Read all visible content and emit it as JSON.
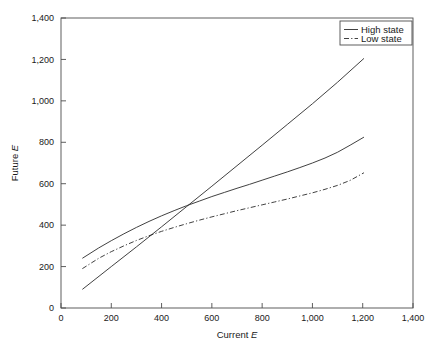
{
  "chart_data": {
    "type": "line",
    "title": "",
    "xlabel": "Current E",
    "ylabel": "Future E",
    "xlim": [
      0,
      1400
    ],
    "ylim": [
      0,
      1400
    ],
    "xticks": [
      "0",
      "200",
      "400",
      "600",
      "800",
      "1,000",
      "1,200",
      "1,400"
    ],
    "yticks": [
      "0",
      "200",
      "400",
      "600",
      "800",
      "1,000",
      "1,200",
      "1,400"
    ],
    "xtick_values": [
      0,
      200,
      400,
      600,
      800,
      1000,
      1200,
      1400
    ],
    "ytick_values": [
      0,
      200,
      400,
      600,
      800,
      1000,
      1200,
      1400
    ],
    "grid": false,
    "legend_position": "top-right",
    "legend": [
      "High state",
      "Low state"
    ],
    "series": [
      {
        "name": "High state",
        "style": "solid",
        "color": "#2b2b2b",
        "comment": "concave increasing curve, upper branch",
        "x": [
          85,
          150,
          200,
          250,
          300,
          350,
          400,
          450,
          500,
          550,
          600,
          650,
          700,
          750,
          800,
          850,
          900,
          950,
          1000,
          1050,
          1100,
          1150,
          1205
        ],
        "y": [
          240,
          290,
          325,
          358,
          389,
          418,
          445,
          470,
          494,
          516,
          538,
          558,
          578,
          597,
          617,
          637,
          657,
          678,
          700,
          724,
          752,
          786,
          825
        ]
      },
      {
        "name": "High state",
        "style": "solid",
        "color": "#2b2b2b",
        "comment": "near-linear steeply rising line, lower-left to upper-right",
        "x": [
          85,
          200,
          300,
          400,
          500,
          600,
          700,
          800,
          900,
          1000,
          1100,
          1205
        ],
        "y": [
          90,
          200,
          295,
          392,
          490,
          588,
          687,
          786,
          886,
          986,
          1090,
          1205
        ]
      },
      {
        "name": "Low state",
        "style": "dashdot",
        "color": "#2b2b2b",
        "comment": "lower concave increasing dash-dot curve",
        "x": [
          85,
          150,
          200,
          250,
          300,
          350,
          400,
          450,
          500,
          550,
          600,
          650,
          700,
          750,
          800,
          850,
          900,
          950,
          1000,
          1050,
          1100,
          1150,
          1205
        ],
        "y": [
          190,
          240,
          272,
          300,
          326,
          349,
          370,
          389,
          407,
          424,
          440,
          455,
          470,
          484,
          498,
          512,
          526,
          541,
          556,
          573,
          592,
          616,
          653
        ]
      }
    ]
  },
  "axes": {
    "x_title_text": "Current ",
    "x_title_italic": "E",
    "y_title_text": "Future ",
    "y_title_italic": "E"
  },
  "legend": {
    "items": [
      {
        "label": "High state",
        "style": "solid"
      },
      {
        "label": "Low state",
        "style": "dashdot"
      }
    ]
  }
}
